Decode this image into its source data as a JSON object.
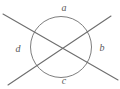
{
  "figure": {
    "stroke_color": "#6e6e6e",
    "label_color": "#5a5a5a",
    "background_color": "#ffffff",
    "circle": {
      "center_x": 61,
      "center_y": 47,
      "radius": 30.5,
      "stroke_width": 0.9
    },
    "lines": [
      {
        "name": "line-descending",
        "x1": 3,
        "y1": 14,
        "x2": 118,
        "y2": 80,
        "stroke_width": 1.1
      },
      {
        "name": "line-ascending",
        "x1": 8,
        "y1": 85,
        "x2": 111,
        "y2": 16,
        "stroke_width": 1.1
      }
    ],
    "intersection": {
      "x": 61,
      "y": 47
    },
    "labels": {
      "top": "a",
      "right": "b",
      "bottom": "c",
      "left": "d"
    }
  }
}
